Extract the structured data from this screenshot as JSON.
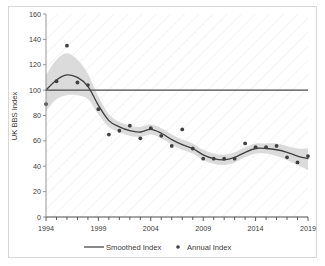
{
  "chart_data": {
    "type": "line",
    "title": "",
    "subtitle": "",
    "xlabel": "",
    "ylabel": "UK BBS Index",
    "xlim": [
      1994,
      2019
    ],
    "ylim": [
      0,
      160
    ],
    "ytick_labels": [
      "0",
      "20",
      "40",
      "60",
      "80",
      "100",
      "120",
      "140",
      "160"
    ],
    "ytick_values": [
      0,
      20,
      40,
      60,
      80,
      100,
      120,
      140,
      160
    ],
    "xtick_labels": [
      "1994",
      "1999",
      "2004",
      "2009",
      "2014",
      "2019"
    ],
    "xtick_values": [
      1994,
      1999,
      2004,
      2009,
      2014,
      2019
    ],
    "minor_xticks_every": 1,
    "grid": false,
    "legend_position": "bottom",
    "x": [
      1994,
      1995,
      1996,
      1997,
      1998,
      1999,
      2000,
      2001,
      2002,
      2003,
      2004,
      2005,
      2006,
      2007,
      2008,
      2009,
      2010,
      2011,
      2012,
      2013,
      2014,
      2015,
      2016,
      2017,
      2018,
      2019
    ],
    "series": [
      {
        "name": "Annual Index",
        "type": "scatter",
        "marker": "circle",
        "color": "#3f3f3f",
        "values": [
          89,
          107,
          135,
          106,
          104,
          85,
          65,
          68,
          72,
          62,
          70,
          64,
          56,
          69,
          54,
          46,
          46,
          46,
          46,
          58,
          55,
          55,
          56,
          47,
          43,
          48
        ]
      },
      {
        "name": "Smoothed Index",
        "type": "line",
        "color": "#3f3f3f",
        "values": [
          100,
          108,
          112,
          110,
          103,
          88,
          76,
          71,
          68,
          67,
          69,
          66,
          61,
          57,
          54,
          49,
          46,
          45,
          47,
          51,
          54,
          54,
          53,
          51,
          48,
          46
        ]
      },
      {
        "name": "Confidence band upper",
        "type": "band-upper",
        "color": "#d6d6d6",
        "values": [
          112,
          124,
          129,
          124,
          113,
          95,
          81,
          75,
          72,
          71,
          73,
          70,
          65,
          61,
          58,
          53,
          50,
          49,
          51,
          55,
          58,
          58,
          58,
          56,
          54,
          54
        ]
      },
      {
        "name": "Confidence band lower",
        "type": "band-lower",
        "color": "#d6d6d6",
        "values": [
          84,
          93,
          96,
          96,
          93,
          81,
          71,
          67,
          64,
          63,
          65,
          62,
          57,
          53,
          50,
          45,
          42,
          41,
          43,
          47,
          50,
          50,
          48,
          45,
          41,
          37
        ]
      }
    ],
    "reference_line": {
      "name": "baseline-100",
      "value": 100,
      "color": "#4a4a4a",
      "label": ""
    }
  },
  "legend": {
    "items": [
      {
        "label": "Smoothed Index",
        "marker": "line",
        "color": "#4a4a4a"
      },
      {
        "label": "Annual Index",
        "marker": "dot",
        "color": "#3f3f3f"
      }
    ]
  }
}
